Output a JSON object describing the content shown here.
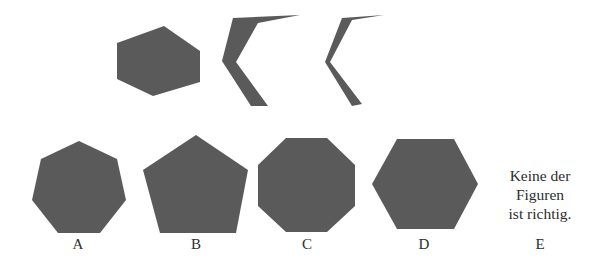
{
  "colors": {
    "shape_fill": "#5a5a5a",
    "background": "#ffffff",
    "text": "#2d2d2d"
  },
  "question": {
    "pieces": [
      {
        "name": "irregular-hexagon-piece",
        "points": "117,43 164,26 200,51 200,82 153,96 117,79"
      },
      {
        "name": "thick-chevron-piece",
        "points": "233,18 300,15 258,23 236,62 268,106 251,106 222,61"
      },
      {
        "name": "thin-chevron-piece",
        "points": "342,18 384,15 352,20 330,62 362,104 352,106 325,62"
      }
    ]
  },
  "options": [
    {
      "label": "A",
      "shape": "heptagon",
      "points": "79,141 117,159 126,200 100,233 58,233 32,200 41,159"
    },
    {
      "label": "B",
      "shape": "pentagon",
      "points": "196,135 248,170 236,233 160,233 143,170"
    },
    {
      "label": "C",
      "shape": "octagon",
      "points": "286,138 327,138 355,165 355,206 327,232 286,232 258,206 258,165"
    },
    {
      "label": "D",
      "shape": "hexagon",
      "points": "397,139 454,139 478,184 454,229 397,229 372,184"
    },
    {
      "label": "E",
      "shape": "none",
      "text_lines": [
        "Keine der",
        "Figuren",
        "ist richtig."
      ]
    }
  ]
}
